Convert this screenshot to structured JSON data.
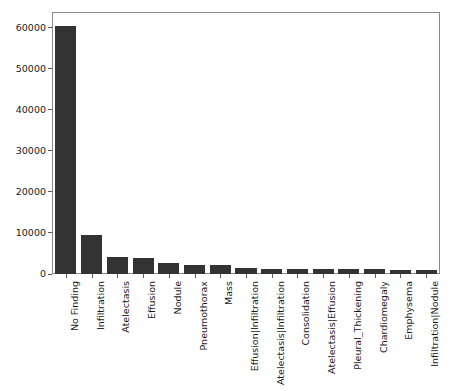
{
  "chart_data": {
    "type": "bar",
    "title": "",
    "xlabel": "",
    "ylabel": "",
    "ylim": [
      0,
      62000
    ],
    "yticks": [
      0,
      10000,
      20000,
      30000,
      40000,
      50000,
      60000
    ],
    "ytick_labels": [
      "0",
      "10000",
      "20000",
      "30000",
      "40000",
      "50000",
      "60000"
    ],
    "grid": false,
    "legend": false,
    "bar_color": "#333333",
    "frame_color": "#8a8a8a",
    "categories": [
      "No Finding",
      "Infiltration",
      "Atelectasis",
      "Effusion",
      "Nodule",
      "Pneumothorax",
      "Mass",
      "Effusion|Infiltration",
      "Atelectasis|Infiltration",
      "Consolidation",
      "Atelectasis|Effusion",
      "Pleural_Thickening",
      "Chardiomegaly",
      "Emphysema",
      "Infiltration|Nodule"
    ],
    "values": [
      60350,
      9550,
      4215,
      3955,
      2705,
      2195,
      2140,
      1530,
      1310,
      1310,
      1250,
      1240,
      1230,
      895,
      870
    ]
  }
}
